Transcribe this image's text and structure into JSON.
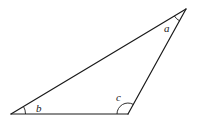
{
  "diagram": {
    "type": "triangle",
    "vertices": {
      "A": {
        "x": 186,
        "y": 9
      },
      "B": {
        "x": 11,
        "y": 114
      },
      "C": {
        "x": 128,
        "y": 114
      }
    },
    "angles": [
      {
        "vertex": "A",
        "label": "a"
      },
      {
        "vertex": "B",
        "label": "b"
      },
      {
        "vertex": "C",
        "label": "c"
      }
    ],
    "colors": {
      "line": "#1a1a1a",
      "label": "#222222",
      "background": "#ffffff"
    }
  }
}
